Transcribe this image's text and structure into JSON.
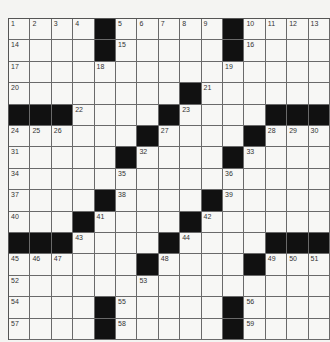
{
  "puzzle": {
    "rows": 15,
    "cols": 15,
    "colors": {
      "black": "#111111",
      "white": "#f7f7f5",
      "line": "#6a6a6a"
    },
    "layout": [
      ".....#.....#....",
      "x"
    ],
    "grid": [
      "....#.....#....",
      "....#.....#....",
      "...............",
      "........#......",
      "###....#....###",
      "......#....#...",
      ".....#....#....",
      "...............",
      "....#....#.....",
      "...#....#......",
      "###....#....###",
      "......#....#...",
      "...............",
      "....#.....#....",
      "....#.....#...."
    ],
    "numbers": [
      {
        "r": 0,
        "c": 0,
        "n": "1"
      },
      {
        "r": 0,
        "c": 1,
        "n": "2"
      },
      {
        "r": 0,
        "c": 2,
        "n": "3"
      },
      {
        "r": 0,
        "c": 3,
        "n": "4"
      },
      {
        "r": 0,
        "c": 5,
        "n": "5"
      },
      {
        "r": 0,
        "c": 6,
        "n": "6"
      },
      {
        "r": 0,
        "c": 7,
        "n": "7"
      },
      {
        "r": 0,
        "c": 8,
        "n": "8"
      },
      {
        "r": 0,
        "c": 9,
        "n": "9"
      },
      {
        "r": 0,
        "c": 11,
        "n": "10"
      },
      {
        "r": 0,
        "c": 12,
        "n": "11"
      },
      {
        "r": 0,
        "c": 13,
        "n": "12"
      },
      {
        "r": 0,
        "c": 14,
        "n": "13"
      },
      {
        "r": 1,
        "c": 0,
        "n": "14"
      },
      {
        "r": 1,
        "c": 5,
        "n": "15"
      },
      {
        "r": 1,
        "c": 11,
        "n": "16"
      },
      {
        "r": 2,
        "c": 0,
        "n": "17"
      },
      {
        "r": 2,
        "c": 4,
        "n": "18"
      },
      {
        "r": 2,
        "c": 10,
        "n": "19"
      },
      {
        "r": 3,
        "c": 0,
        "n": "20"
      },
      {
        "r": 3,
        "c": 9,
        "n": "21"
      },
      {
        "r": 4,
        "c": 3,
        "n": "22"
      },
      {
        "r": 4,
        "c": 8,
        "n": "23"
      },
      {
        "r": 5,
        "c": 0,
        "n": "24"
      },
      {
        "r": 5,
        "c": 1,
        "n": "25"
      },
      {
        "r": 5,
        "c": 2,
        "n": "26"
      },
      {
        "r": 5,
        "c": 7,
        "n": "27"
      },
      {
        "r": 5,
        "c": 12,
        "n": "28"
      },
      {
        "r": 5,
        "c": 13,
        "n": "29"
      },
      {
        "r": 5,
        "c": 14,
        "n": "30"
      },
      {
        "r": 6,
        "c": 0,
        "n": "31"
      },
      {
        "r": 6,
        "c": 6,
        "n": "32"
      },
      {
        "r": 6,
        "c": 11,
        "n": "33"
      },
      {
        "r": 7,
        "c": 0,
        "n": "34"
      },
      {
        "r": 7,
        "c": 5,
        "n": "35"
      },
      {
        "r": 7,
        "c": 10,
        "n": "36"
      },
      {
        "r": 8,
        "c": 0,
        "n": "37"
      },
      {
        "r": 8,
        "c": 5,
        "n": "38"
      },
      {
        "r": 8,
        "c": 10,
        "n": "39"
      },
      {
        "r": 9,
        "c": 0,
        "n": "40"
      },
      {
        "r": 9,
        "c": 4,
        "n": "41"
      },
      {
        "r": 9,
        "c": 9,
        "n": "42"
      },
      {
        "r": 10,
        "c": 3,
        "n": "43"
      },
      {
        "r": 10,
        "c": 8,
        "n": "44"
      },
      {
        "r": 11,
        "c": 0,
        "n": "45"
      },
      {
        "r": 11,
        "c": 1,
        "n": "46"
      },
      {
        "r": 11,
        "c": 2,
        "n": "47"
      },
      {
        "r": 11,
        "c": 7,
        "n": "48"
      },
      {
        "r": 11,
        "c": 12,
        "n": "49"
      },
      {
        "r": 11,
        "c": 13,
        "n": "50"
      },
      {
        "r": 11,
        "c": 14,
        "n": "51"
      },
      {
        "r": 12,
        "c": 0,
        "n": "52"
      },
      {
        "r": 12,
        "c": 6,
        "n": "53"
      },
      {
        "r": 13,
        "c": 0,
        "n": "54"
      },
      {
        "r": 13,
        "c": 5,
        "n": "55"
      },
      {
        "r": 13,
        "c": 11,
        "n": "56"
      },
      {
        "r": 14,
        "c": 0,
        "n": "57"
      },
      {
        "r": 14,
        "c": 5,
        "n": "58"
      },
      {
        "r": 14,
        "c": 11,
        "n": "59"
      }
    ]
  }
}
